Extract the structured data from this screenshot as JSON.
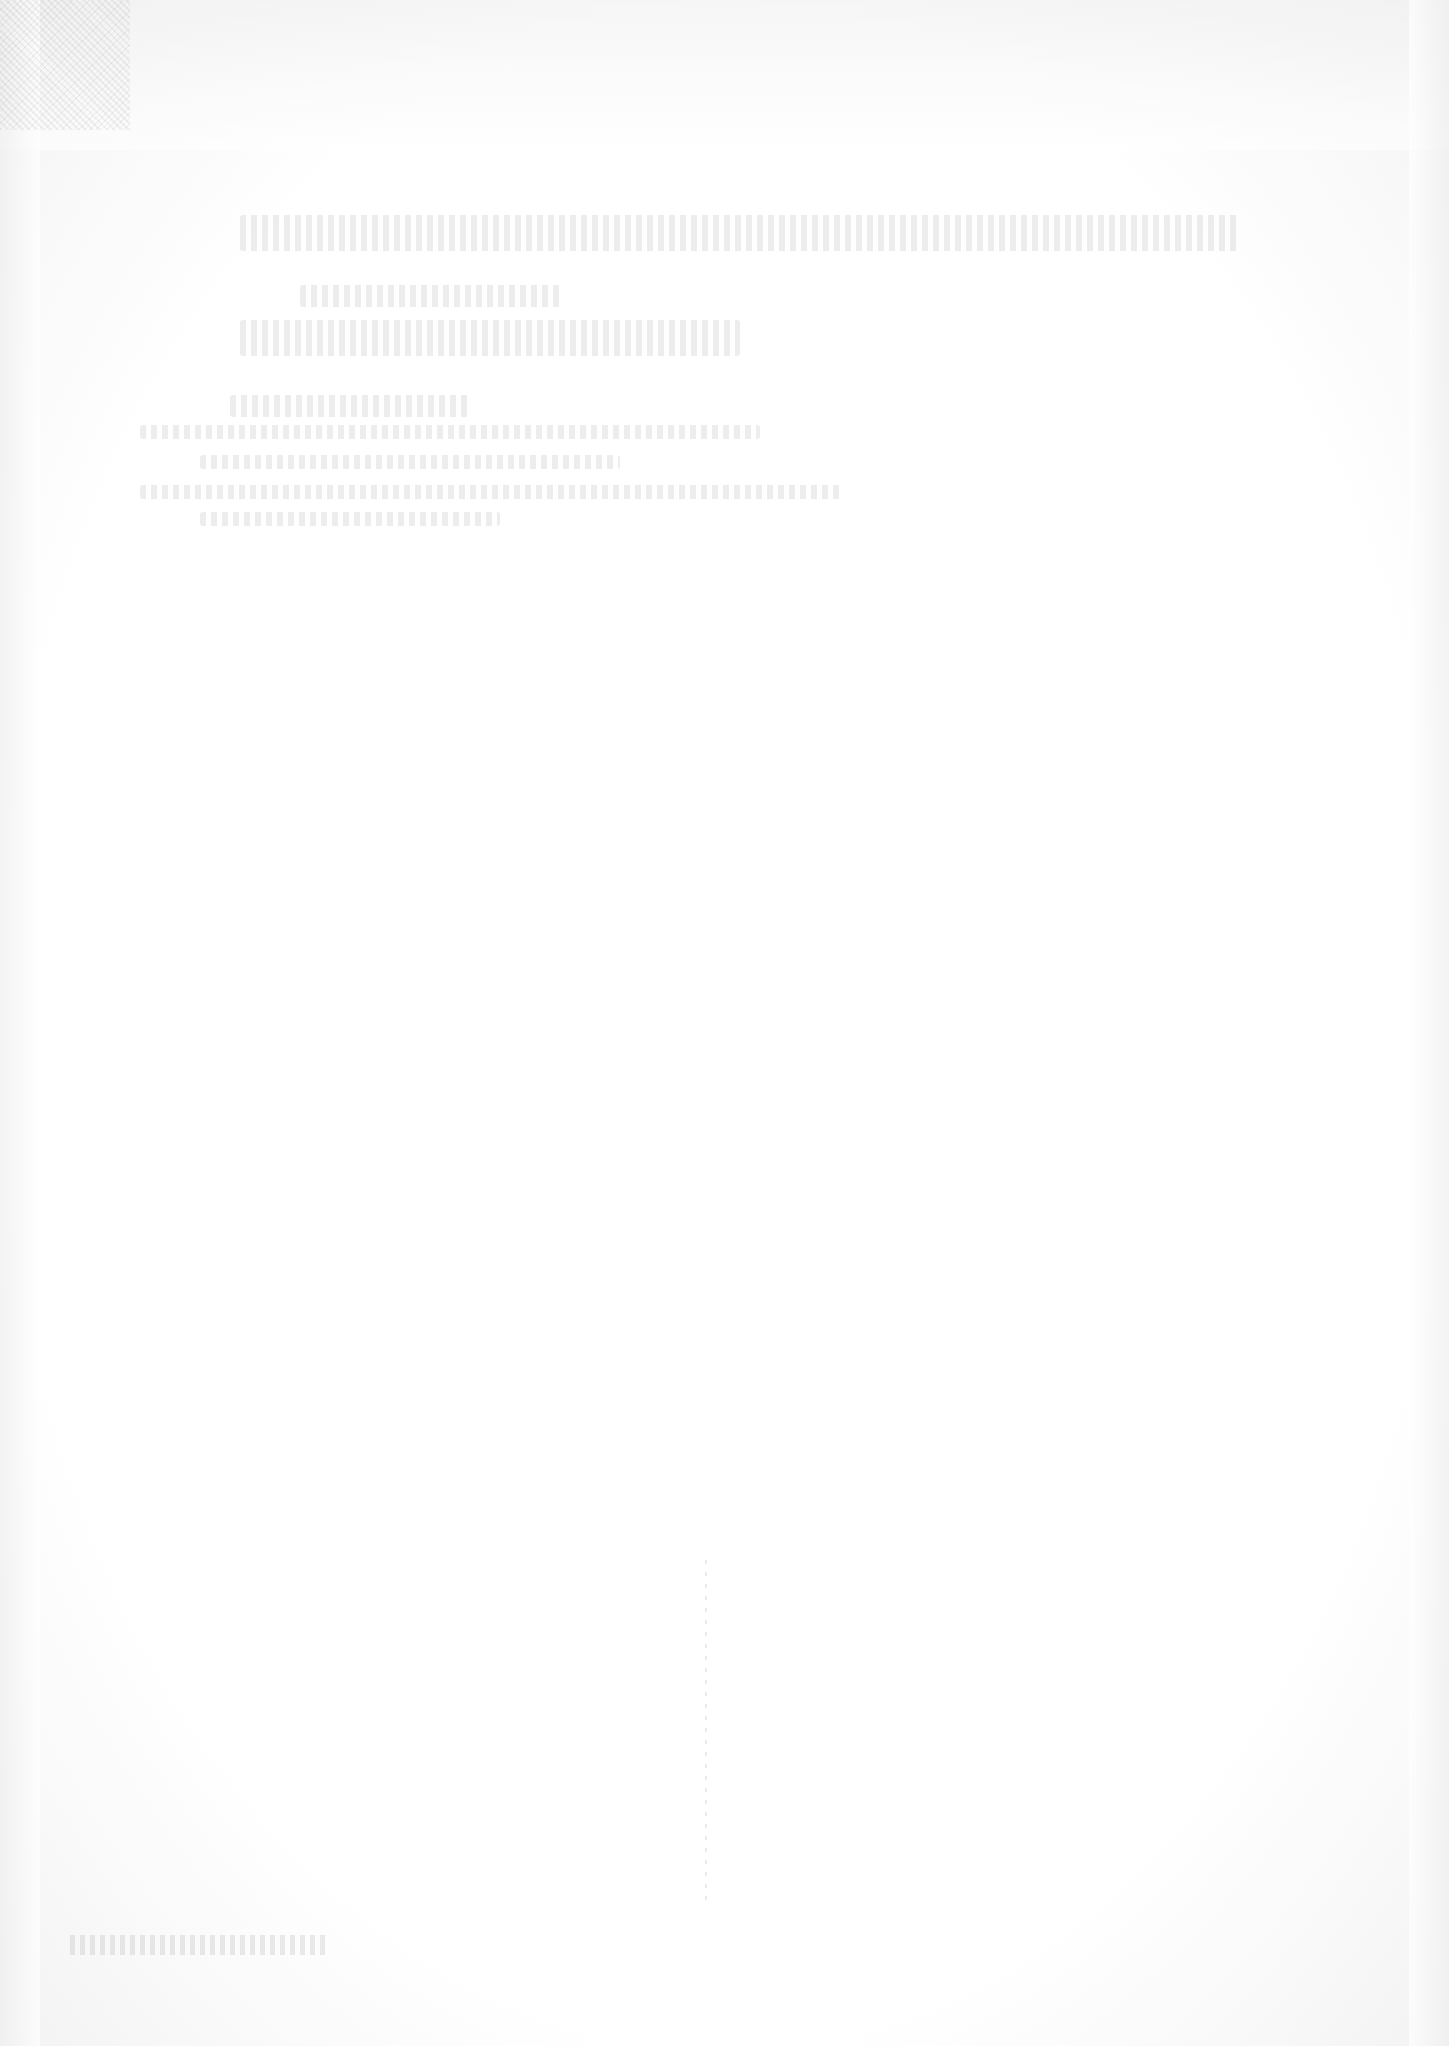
{
  "document": {
    "heading_line_1": "",
    "heading_line_2": "",
    "subtitle_line_1": "",
    "subtitle_line_2": "",
    "body_lines": [
      "",
      "",
      "",
      ""
    ],
    "footer_mark": ""
  },
  "colors": {
    "background": "#ffffff",
    "faint_ink": "#d8d8d8"
  }
}
